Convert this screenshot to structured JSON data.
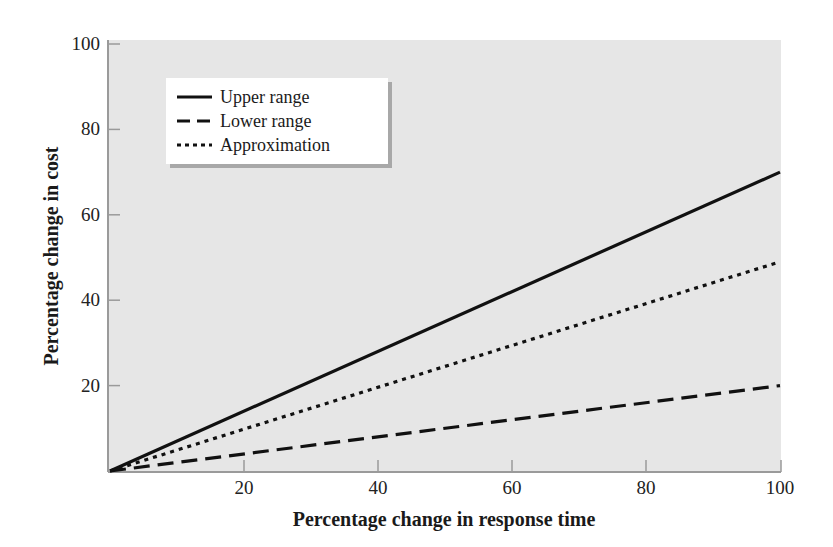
{
  "chart_data": {
    "type": "line",
    "title": "",
    "xlabel": "Percentage change in response time",
    "ylabel": "Percentage change in cost",
    "xlim": [
      0,
      100
    ],
    "ylim": [
      0,
      100
    ],
    "x_ticks": [
      20,
      40,
      60,
      80,
      100
    ],
    "y_ticks": [
      20,
      40,
      60,
      80,
      100
    ],
    "grid": false,
    "legend_position": "upper-left",
    "x": [
      0,
      100
    ],
    "series": [
      {
        "name": "Upper range",
        "style": "solid",
        "values": [
          0,
          70
        ]
      },
      {
        "name": "Lower range",
        "style": "dashed",
        "values": [
          0,
          20
        ]
      },
      {
        "name": "Approximation",
        "style": "dotted",
        "values": [
          0,
          49
        ]
      }
    ]
  },
  "colors": {
    "plot_background": "#e6e6e6",
    "line": "#111111",
    "axis": "#9a9a9a",
    "legend_background": "#ffffff"
  }
}
